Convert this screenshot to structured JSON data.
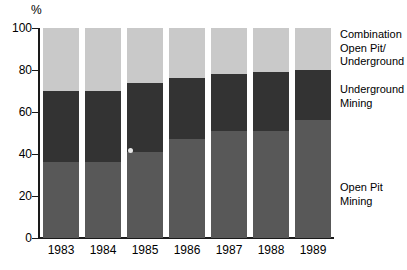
{
  "chart_data": {
    "type": "bar",
    "subtype": "stacked-percentage",
    "title": "",
    "xlabel": "",
    "ylabel": "%",
    "ylim": [
      0,
      100
    ],
    "yticks": [
      0,
      20,
      40,
      60,
      80,
      100
    ],
    "ytick_labels": [
      "0",
      "20",
      "40",
      "60",
      "80",
      "100"
    ],
    "grid": false,
    "legend_position": "right",
    "categories": [
      "1983",
      "1984",
      "1985",
      "1986",
      "1987",
      "1988",
      "1989"
    ],
    "series": [
      {
        "name": "Open Pit Mining",
        "color": "#585858",
        "values": [
          36,
          36,
          41,
          47,
          51,
          51,
          56
        ]
      },
      {
        "name": "Underground Mining",
        "color": "#333333",
        "values": [
          34,
          34,
          33,
          29,
          27,
          28,
          24
        ]
      },
      {
        "name": "Combination Open Pit/ Underground",
        "color": "#c9c9c9",
        "values": [
          30,
          30,
          26,
          24,
          22,
          21,
          20
        ]
      }
    ],
    "cumulative_tops": {
      "open_pit": [
        36,
        36,
        41,
        47,
        51,
        51,
        56
      ],
      "underground": [
        70,
        70,
        74,
        76,
        78,
        79,
        80
      ],
      "combination": [
        100,
        100,
        100,
        100,
        100,
        100,
        100
      ]
    }
  },
  "axis": {
    "y_unit_label": "%",
    "ticks": [
      "100",
      "80",
      "60",
      "40",
      "20",
      "0"
    ]
  },
  "xaxis": {
    "labels": [
      "1983",
      "1984",
      "1985",
      "1986",
      "1987",
      "1988",
      "1989"
    ]
  },
  "legend": {
    "combination": {
      "line1": "Combination",
      "line2": "Open Pit/",
      "line3": "Underground"
    },
    "underground": {
      "line1": "Underground",
      "line2": "Mining"
    },
    "open_pit": {
      "line1": "Open Pit",
      "line2": "Mining"
    }
  },
  "colors": {
    "combination": "#c9c9c9",
    "underground": "#333333",
    "open_pit": "#585858",
    "axis": "#1a1a1a",
    "background": "#ffffff"
  }
}
